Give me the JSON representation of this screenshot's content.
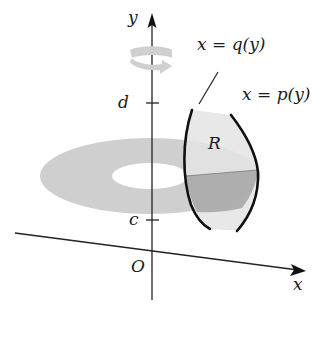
{
  "figure": {
    "axes": {
      "x_label": "x",
      "y_label": "y",
      "origin_label": "O"
    },
    "ticks": {
      "upper": "d",
      "lower": "c"
    },
    "curves": {
      "inner": "x = q(y)",
      "outer": "x = p(y)"
    },
    "region_label": "R",
    "colors": {
      "axis": "#222222",
      "curve": "#111111",
      "washer": "#cfcfcf",
      "washer_hole": "#ffffff",
      "region": "#e6e6e6",
      "cross_section": "#a9a9a9",
      "rotation_arrow": "#cccccc"
    }
  }
}
